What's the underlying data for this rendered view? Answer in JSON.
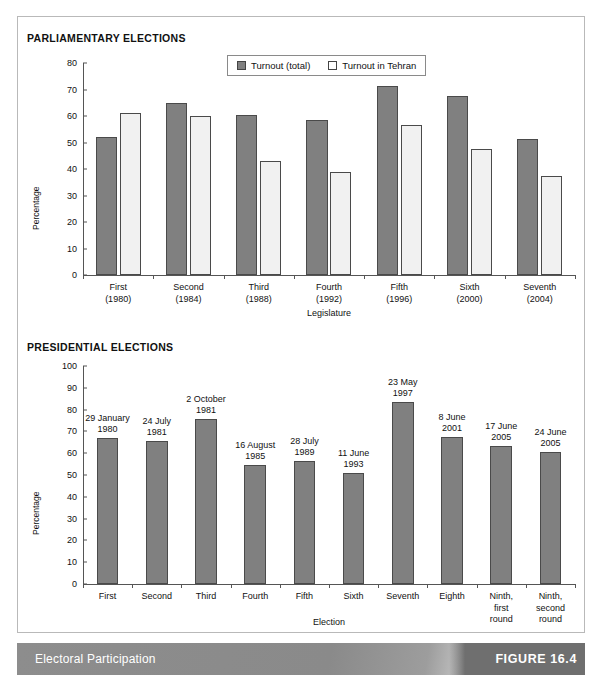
{
  "figure": {
    "footer_title": "Electoral Participation",
    "figure_number": "FIGURE 16.4"
  },
  "sections": {
    "parliamentary_title": "PARLIAMENTARY ELECTIONS",
    "presidential_title": "PRESIDENTIAL ELECTIONS"
  },
  "legend": {
    "total_label": "Turnout (total)",
    "tehran_label": "Turnout in Tehran"
  },
  "colors": {
    "bar_total": "#808080",
    "bar_tehran": "#f1f1f1",
    "bar_single": "#808080",
    "axis": "#555555",
    "footer_band": "#8d8d8d",
    "footer_figure_block": "#6f6f6f"
  },
  "chart_data": [
    {
      "id": "parliamentary",
      "type": "bar",
      "title": "PARLIAMENTARY ELECTIONS",
      "xlabel": "Legislature",
      "ylabel": "Percentage",
      "ylim": [
        0,
        80
      ],
      "yticks": [
        0,
        10,
        20,
        30,
        40,
        50,
        60,
        70,
        80
      ],
      "grid": false,
      "legend_position": "top-center",
      "categories": [
        "First\n(1980)",
        "Second\n(1984)",
        "Third\n(1988)",
        "Fourth\n(1992)",
        "Fifth\n(1996)",
        "Sixth\n(2000)",
        "Seventh\n(2004)"
      ],
      "category_lines": [
        [
          "First",
          "(1980)"
        ],
        [
          "Second",
          "(1984)"
        ],
        [
          "Third",
          "(1988)"
        ],
        [
          "Fourth",
          "(1992)"
        ],
        [
          "Fifth",
          "(1996)"
        ],
        [
          "Sixth",
          "(2000)"
        ],
        [
          "Seventh",
          "(2004)"
        ]
      ],
      "series": [
        {
          "name": "Turnout (total)",
          "values": [
            52.0,
            65.0,
            60.5,
            58.5,
            71.5,
            67.5,
            51.5
          ]
        },
        {
          "name": "Turnout in Tehran",
          "values": [
            61.0,
            60.0,
            43.0,
            39.0,
            56.5,
            47.5,
            37.5
          ]
        }
      ]
    },
    {
      "id": "presidential",
      "type": "bar",
      "title": "PRESIDENTIAL ELECTIONS",
      "xlabel": "Election",
      "ylabel": "Percentage",
      "ylim": [
        0,
        100
      ],
      "yticks": [
        0,
        10,
        20,
        30,
        40,
        50,
        60,
        70,
        80,
        90,
        100
      ],
      "grid": false,
      "legend_position": "none",
      "categories": [
        "First",
        "Second",
        "Third",
        "Fourth",
        "Fifth",
        "Sixth",
        "Seventh",
        "Eighth",
        "Ninth, first round",
        "Ninth, second round"
      ],
      "category_lines": [
        [
          "First"
        ],
        [
          "Second"
        ],
        [
          "Third"
        ],
        [
          "Fourth"
        ],
        [
          "Fifth"
        ],
        [
          "Sixth"
        ],
        [
          "Seventh"
        ],
        [
          "Eighth"
        ],
        [
          "Ninth,",
          "first",
          "round"
        ],
        [
          "Ninth,",
          "second",
          "round"
        ]
      ],
      "annotations": [
        [
          "29 January",
          "1980"
        ],
        [
          "24 July",
          "1981"
        ],
        [
          "2 October",
          "1981"
        ],
        [
          "16 August",
          "1985"
        ],
        [
          "28 July",
          "1989"
        ],
        [
          "11 June",
          "1993"
        ],
        [
          "23 May",
          "1997"
        ],
        [
          "8 June",
          "2001"
        ],
        [
          "17 June",
          "2005"
        ],
        [
          "24 June",
          "2005"
        ]
      ],
      "series": [
        {
          "name": "Turnout",
          "values": [
            67.0,
            65.5,
            75.5,
            54.5,
            56.5,
            51.0,
            83.5,
            67.5,
            63.5,
            60.5
          ]
        }
      ]
    }
  ]
}
